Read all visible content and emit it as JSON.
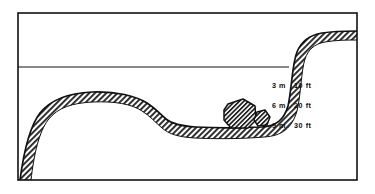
{
  "figure": {
    "background_color": "#ffffff",
    "ink_color": "#111111",
    "hatch_color": "#2b2b2b"
  },
  "frame": {
    "name": "border-rectangle",
    "x": 18,
    "y": 13,
    "width": 339,
    "height": 167,
    "stroke_color": "#111111"
  },
  "water_surface": {
    "label": "",
    "y": 67,
    "x_start": 18,
    "x_end": 289,
    "stroke_color": "#111111"
  },
  "depth_scale": {
    "name": "depth-markings",
    "x": 272,
    "entries": [
      {
        "metric": "3 m",
        "imperial": "10 ft",
        "y": 86
      },
      {
        "metric": "6 m",
        "imperial": "20 ft",
        "y": 106
      },
      {
        "metric": "9 m",
        "imperial": "30 ft",
        "y": 126
      }
    ]
  },
  "seabed": {
    "name": "seabed-profile",
    "fill": "diagonal-hatch",
    "features": [
      "left rising slope from bottom-left corner",
      "rounded bank crest",
      "descending shoulder",
      "flat trough",
      "steep right cliff",
      "upper right plateau"
    ]
  },
  "rocks": [
    {
      "name": "large-boulder",
      "cx": 241,
      "cy": 112,
      "size": "large"
    },
    {
      "name": "small-boulder",
      "cx": 263,
      "cy": 119,
      "size": "small"
    }
  ]
}
